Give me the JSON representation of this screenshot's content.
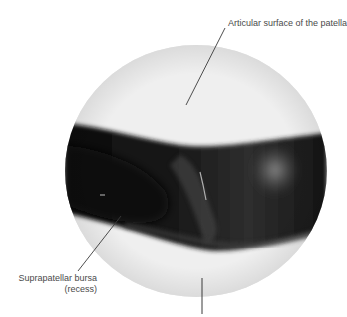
{
  "figure": {
    "type": "arthroscopic-view",
    "labels": {
      "top": "Articular surface of the patella",
      "left_line1": "Suprapatellar bursa",
      "left_line2": "(recess)"
    },
    "colors": {
      "background": "#ffffff",
      "label_text": "#4a4a4a",
      "leader_line": "#3a3a3a",
      "cartilage": "#eeeeee",
      "cavity_dark": "#151515"
    }
  }
}
